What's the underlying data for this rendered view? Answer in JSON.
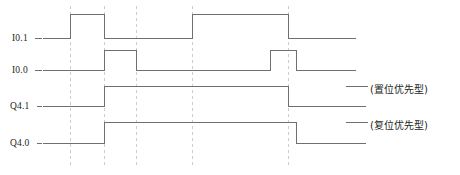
{
  "diagram": {
    "stroke_color": "#6f6f6f",
    "dash_color": "#cccccc",
    "text_color": "#231f20",
    "signals": [
      {
        "id": "i0-1",
        "label": "I0.1",
        "label_x": 12,
        "label_y": 33,
        "lead_x1": 35,
        "lead_x2": 42,
        "baseline_y": 38,
        "high_y": 14,
        "end_x": 355,
        "pulses": [
          {
            "start": 70,
            "end": 104
          },
          {
            "start": 192,
            "end": 288
          }
        ]
      },
      {
        "id": "i0-0",
        "label": "I0.0",
        "label_x": 12,
        "label_y": 65,
        "lead_x1": 35,
        "lead_x2": 42,
        "baseline_y": 70,
        "high_y": 50,
        "end_x": 355,
        "pulses": [
          {
            "start": 104,
            "end": 136
          },
          {
            "start": 270,
            "end": 296
          }
        ]
      },
      {
        "id": "q4-1",
        "label": "Q4.1",
        "label_x": 10,
        "label_y": 101,
        "lead_x1": 37,
        "lead_x2": 42,
        "baseline_y": 106,
        "high_y": 86,
        "end_x": 365,
        "pulses": [
          {
            "start": 104,
            "end": 288
          }
        ]
      },
      {
        "id": "q4-0",
        "label": "Q4.0",
        "label_x": 10,
        "label_y": 138,
        "lead_x1": 37,
        "lead_x2": 42,
        "baseline_y": 143,
        "high_y": 122,
        "end_x": 365,
        "pulses": [
          {
            "start": 104,
            "end": 296
          }
        ]
      }
    ],
    "time_markers": [
      {
        "x": 70,
        "y1": 6,
        "y2": 166
      },
      {
        "x": 104,
        "y1": 6,
        "y2": 166
      },
      {
        "x": 136,
        "y1": 6,
        "y2": 166
      },
      {
        "x": 192,
        "y1": 6,
        "y2": 166
      },
      {
        "x": 288,
        "y1": 6,
        "y2": 166
      }
    ],
    "annotations": [
      {
        "id": "set-priority",
        "text": "(置位优先型)",
        "x": 370,
        "y": 81,
        "lead_x1": 346,
        "lead_x2": 368,
        "lead_y": 86
      },
      {
        "id": "reset-priority",
        "text": "(复位优先型)",
        "x": 370,
        "y": 117,
        "lead_x1": 346,
        "lead_x2": 368,
        "lead_y": 122
      }
    ]
  },
  "chart_data": {
    "type": "line",
    "xlabel": "",
    "ylabel": "",
    "grid": false,
    "legend_position": "right",
    "x": [
      0,
      70,
      104,
      136,
      192,
      270,
      288,
      296,
      365
    ],
    "series": [
      {
        "name": "I0.1",
        "values": [
          0,
          1,
          0,
          0,
          1,
          1,
          0,
          0,
          0
        ],
        "note": "set input"
      },
      {
        "name": "I0.0",
        "values": [
          0,
          0,
          1,
          0,
          0,
          1,
          1,
          0,
          0
        ],
        "note": "reset input"
      },
      {
        "name": "Q4.1",
        "values": [
          0,
          0,
          1,
          1,
          1,
          1,
          0,
          0,
          0
        ],
        "note": "set-dominant output"
      },
      {
        "name": "Q4.0",
        "values": [
          0,
          0,
          1,
          1,
          1,
          1,
          1,
          0,
          0
        ],
        "note": "reset-dominant output"
      }
    ],
    "annotations": [
      "(置位优先型)",
      "(复位优先型)"
    ],
    "ylim": [
      0,
      1
    ]
  }
}
